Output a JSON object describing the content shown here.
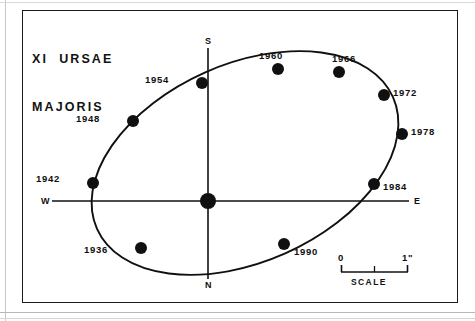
{
  "figure": {
    "title_line1": "XI  URSAE",
    "title_line2": "MAJORIS",
    "frame": {
      "x": 22,
      "y": 10,
      "width": 436,
      "height": 293
    },
    "ink_color": "#101010",
    "background_color": "#ffffff"
  },
  "compass": {
    "north_label": "N",
    "south_label": "S",
    "east_label": "E",
    "west_label": "W"
  },
  "scale_bar": {
    "start_label": "0",
    "end_label": "1\"",
    "caption": "SCALE",
    "tick_count": 3,
    "arcsec_span": 1
  },
  "chart_data": {
    "type": "scatter",
    "title": "XI URSAE MAJORIS",
    "subtitle": "",
    "xlabel": "",
    "ylabel": "",
    "grid": false,
    "legend_position": "none",
    "axis_convention": {
      "up": "S",
      "down": "N",
      "left": "W",
      "right": "E"
    },
    "primary_star": {
      "label": "primary",
      "x_px": 208,
      "y_px": 201,
      "radius_px": 8
    },
    "orbit_ellipse": {
      "center_x_px": 245,
      "center_y_px": 163,
      "semi_major_px": 162,
      "semi_minor_px": 99,
      "rotation_deg": -24
    },
    "epoch_point_radius_px": 6,
    "categories": [
      "1936",
      "1942",
      "1948",
      "1954",
      "1960",
      "1966",
      "1972",
      "1978",
      "1984",
      "1990"
    ],
    "points": [
      {
        "epoch": "1936",
        "x_px": 141,
        "y_px": 248,
        "label_x_px": 108,
        "label_y_px": 250,
        "label_anchor": "end"
      },
      {
        "epoch": "1942",
        "x_px": 93,
        "y_px": 183,
        "label_x_px": 60,
        "label_y_px": 179,
        "label_anchor": "end"
      },
      {
        "epoch": "1948",
        "x_px": 133,
        "y_px": 121,
        "label_x_px": 100,
        "label_y_px": 119,
        "label_anchor": "end"
      },
      {
        "epoch": "1954",
        "x_px": 202,
        "y_px": 83,
        "label_x_px": 169,
        "label_y_px": 80,
        "label_anchor": "end"
      },
      {
        "epoch": "1960",
        "x_px": 278,
        "y_px": 69,
        "label_x_px": 271,
        "label_y_px": 56,
        "label_anchor": "middle"
      },
      {
        "epoch": "1966",
        "x_px": 339,
        "y_px": 72,
        "label_x_px": 344,
        "label_y_px": 59,
        "label_anchor": "middle"
      },
      {
        "epoch": "1972",
        "x_px": 384,
        "y_px": 95,
        "label_x_px": 393,
        "label_y_px": 93,
        "label_anchor": "start"
      },
      {
        "epoch": "1978",
        "x_px": 402,
        "y_px": 134,
        "label_x_px": 411,
        "label_y_px": 132,
        "label_anchor": "start"
      },
      {
        "epoch": "1984",
        "x_px": 374,
        "y_px": 184,
        "label_x_px": 383,
        "label_y_px": 187,
        "label_anchor": "start"
      },
      {
        "epoch": "1990",
        "x_px": 284,
        "y_px": 244,
        "label_x_px": 294,
        "label_y_px": 252,
        "label_anchor": "start"
      }
    ]
  }
}
